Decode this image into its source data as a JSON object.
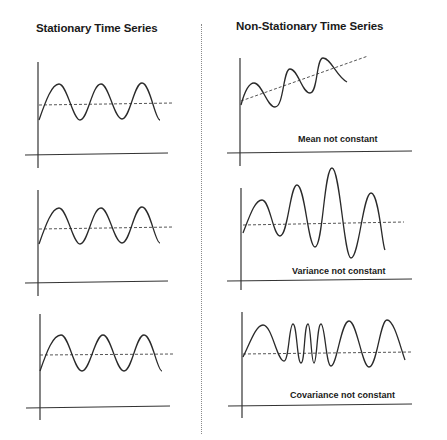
{
  "titles": {
    "left": "Stationary Time Series",
    "right": "Non-Stationary Time Series"
  },
  "panels": {
    "left": [
      {
        "label": ""
      },
      {
        "label": ""
      },
      {
        "label": ""
      }
    ],
    "right": [
      {
        "label": "Mean not constant"
      },
      {
        "label": "Variance not constant"
      },
      {
        "label": "Covariance not constant"
      }
    ]
  },
  "colors": {
    "line": "#2a2a2a",
    "dashed_mean": "#555555",
    "divider": "#8a8a8a"
  }
}
